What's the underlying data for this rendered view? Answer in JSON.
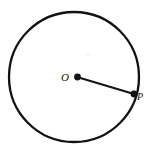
{
  "figure": {
    "kind": "geometry-diagram",
    "canvas": {
      "width": 155,
      "height": 154,
      "background": "#ffffff"
    },
    "stroke_color": "#121212",
    "circle": {
      "name": "circle-outline",
      "center_x": 74,
      "center_y": 77,
      "radius": 65,
      "stroke_width": 2.3,
      "fill": "none"
    },
    "radius_segment": {
      "name": "radius-segment-OP",
      "x1": 77,
      "y1": 77,
      "x2": 134,
      "y2": 94,
      "stroke_width": 1.9
    },
    "points": [
      {
        "id": "O",
        "label": "O",
        "role": "center",
        "dot_x": 77.5,
        "dot_y": 77,
        "dot_radius": 3.4,
        "label_x": 65,
        "label_y": 80.5,
        "label_size": 11
      },
      {
        "id": "P",
        "label": "P",
        "role": "on-circumference",
        "dot_x": 134,
        "dot_y": 94,
        "dot_radius": 3.4,
        "label_x": 140,
        "label_y": 100,
        "label_size": 10
      }
    ],
    "speck": {
      "name": "paper-speck",
      "x": 88,
      "y": 55,
      "radius": 0.75,
      "opacity": 0.18
    }
  }
}
